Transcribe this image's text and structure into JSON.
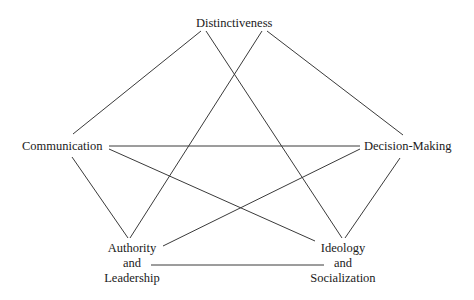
{
  "diagram": {
    "type": "network",
    "background": "#ffffff",
    "line_color": "#3a3a3a",
    "nodes": [
      {
        "id": "distinctiveness",
        "lines": [
          "Distinctiveness"
        ]
      },
      {
        "id": "communication",
        "lines": [
          "Communication"
        ]
      },
      {
        "id": "decision-making",
        "lines": [
          "Decision-Making"
        ]
      },
      {
        "id": "authority-leadership",
        "lines": [
          "Authority",
          "and",
          "Leadership"
        ]
      },
      {
        "id": "ideology-socialization",
        "lines": [
          "Ideology",
          "and",
          "Socialization"
        ]
      }
    ],
    "edges": [
      {
        "from": "Distinctiveness",
        "to": "Communication"
      },
      {
        "from": "Distinctiveness",
        "to": "Decision-Making"
      },
      {
        "from": "Distinctiveness",
        "to": "Ideology and Socialization"
      },
      {
        "from": "Distinctiveness",
        "to": "Authority and Leadership"
      },
      {
        "from": "Communication",
        "to": "Decision-Making"
      },
      {
        "from": "Communication",
        "to": "Ideology and Socialization"
      },
      {
        "from": "Communication",
        "to": "Authority and Leadership"
      },
      {
        "from": "Decision-Making",
        "to": "Authority and Leadership"
      },
      {
        "from": "Decision-Making",
        "to": "Ideology and Socialization"
      },
      {
        "from": "Authority and Leadership",
        "to": "Ideology and Socialization"
      }
    ]
  }
}
